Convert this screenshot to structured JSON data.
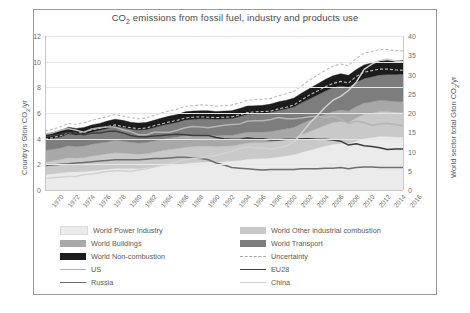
{
  "chart_data": {
    "type": "area",
    "title": "CO2 emissions from fossil fuel, industry and products use",
    "title_parts": {
      "pre": "CO",
      "sub": "2",
      "post": " emissions from fossil fuel, industry and products use"
    },
    "xlabel": "",
    "ylabel": "Country's Gton CO2/yr",
    "ylabel_parts": {
      "pre": "Country's Gton CO",
      "sub": "2",
      "post": "/yr"
    },
    "y2label": "World sector total Gton CO2/yr",
    "y2label_parts": {
      "pre": "World sector total Gton CO",
      "sub": "2",
      "post": "/yr"
    },
    "ylim": [
      0,
      12
    ],
    "y2lim": [
      0,
      40
    ],
    "yticks": [
      0,
      2,
      4,
      6,
      8,
      10,
      12
    ],
    "y2ticks": [
      0,
      5,
      10,
      15,
      20,
      25,
      30,
      35,
      40
    ],
    "grid": true,
    "legend_position": "below",
    "x": [
      1970,
      1971,
      1972,
      1973,
      1974,
      1975,
      1976,
      1977,
      1978,
      1979,
      1980,
      1981,
      1982,
      1983,
      1984,
      1985,
      1986,
      1987,
      1988,
      1989,
      1990,
      1991,
      1992,
      1993,
      1994,
      1995,
      1996,
      1997,
      1998,
      1999,
      2000,
      2001,
      2002,
      2003,
      2004,
      2005,
      2006,
      2007,
      2008,
      2009,
      2010,
      2011,
      2012,
      2013,
      2014,
      2015,
      2016
    ],
    "xticks": [
      "1970",
      "1972",
      "1974",
      "1976",
      "1978",
      "1980",
      "1982",
      "1984",
      "1986",
      "1988",
      "1990",
      "1992",
      "1994",
      "1996",
      "1998",
      "2000",
      "2002",
      "2004",
      "2006",
      "2008",
      "2010",
      "2012",
      "2014",
      "2016"
    ],
    "note_units": "Stacked areas read on right axis (world sector total); country lines read on left axis.",
    "series": [
      {
        "name": "World Power Industry",
        "type": "area-stack",
        "color": "#ebebeb",
        "axis": "right",
        "values": [
          4.0,
          4.2,
          4.4,
          4.7,
          4.7,
          4.8,
          5.0,
          5.2,
          5.4,
          5.6,
          5.6,
          5.6,
          5.6,
          5.7,
          6.0,
          6.3,
          6.5,
          6.7,
          6.9,
          7.1,
          7.2,
          7.3,
          7.3,
          7.4,
          7.5,
          7.7,
          8.0,
          8.1,
          8.2,
          8.3,
          8.6,
          8.9,
          9.2,
          9.8,
          10.3,
          10.9,
          11.4,
          11.9,
          12.1,
          12.0,
          12.7,
          13.4,
          13.6,
          13.9,
          13.9,
          13.8,
          13.7
        ]
      },
      {
        "name": "World Other industrial combustion",
        "type": "area-stack",
        "color": "#c9c9c9",
        "axis": "right",
        "values": [
          3.3,
          3.4,
          3.5,
          3.7,
          3.6,
          3.6,
          3.8,
          3.9,
          4.0,
          4.1,
          4.0,
          3.8,
          3.7,
          3.7,
          3.8,
          3.9,
          4.0,
          4.1,
          4.2,
          4.2,
          4.2,
          4.1,
          4.0,
          4.0,
          4.0,
          4.1,
          4.2,
          4.2,
          4.1,
          4.1,
          4.2,
          4.2,
          4.3,
          4.6,
          4.9,
          5.1,
          5.4,
          5.6,
          5.7,
          5.6,
          6.0,
          6.3,
          6.4,
          6.5,
          6.5,
          6.4,
          6.4
        ]
      },
      {
        "name": "World Buildings",
        "type": "area-stack",
        "color": "#a8a8a8",
        "axis": "right",
        "values": [
          3.0,
          3.0,
          3.0,
          3.1,
          3.0,
          3.0,
          3.1,
          3.1,
          3.1,
          3.2,
          3.1,
          3.0,
          2.9,
          2.9,
          2.9,
          3.0,
          3.0,
          3.0,
          3.1,
          3.0,
          2.9,
          2.9,
          2.8,
          2.8,
          2.7,
          2.8,
          2.9,
          2.8,
          2.8,
          2.8,
          2.8,
          2.8,
          2.8,
          2.9,
          2.9,
          2.9,
          2.9,
          2.9,
          3.0,
          2.9,
          3.0,
          2.9,
          2.9,
          2.9,
          2.8,
          2.8,
          2.8
        ]
      },
      {
        "name": "World Transport",
        "type": "area-stack",
        "color": "#7d7d7d",
        "axis": "right",
        "values": [
          2.7,
          2.8,
          2.9,
          3.1,
          3.0,
          3.1,
          3.2,
          3.3,
          3.5,
          3.6,
          3.5,
          3.4,
          3.4,
          3.4,
          3.5,
          3.6,
          3.7,
          3.8,
          4.0,
          4.1,
          4.2,
          4.2,
          4.3,
          4.3,
          4.4,
          4.5,
          4.6,
          4.7,
          4.8,
          5.0,
          5.1,
          5.2,
          5.3,
          5.4,
          5.6,
          5.8,
          6.0,
          6.2,
          6.2,
          6.2,
          6.3,
          6.4,
          6.5,
          6.6,
          6.8,
          7.0,
          7.2
        ]
      },
      {
        "name": "World Non-combustion",
        "type": "area-stack",
        "color": "#1c1c1c",
        "axis": "right",
        "values": [
          1.5,
          1.5,
          1.6,
          1.7,
          1.7,
          1.7,
          1.8,
          1.8,
          1.9,
          1.9,
          1.9,
          1.8,
          1.8,
          1.8,
          1.9,
          1.9,
          2.0,
          2.0,
          2.1,
          2.1,
          2.1,
          2.1,
          2.0,
          2.0,
          2.0,
          2.1,
          2.1,
          2.1,
          2.1,
          2.1,
          2.2,
          2.2,
          2.3,
          2.5,
          2.7,
          2.8,
          3.0,
          3.1,
          3.2,
          3.1,
          3.3,
          3.5,
          3.6,
          3.6,
          3.6,
          3.5,
          3.5
        ]
      },
      {
        "name": "Uncertainty",
        "type": "line-dashed-band",
        "color": "#bdbdbd",
        "axis": "right",
        "upper": [
          15.3,
          15.8,
          16.4,
          17.3,
          17.1,
          17.4,
          18.1,
          18.6,
          19.1,
          19.6,
          19.2,
          18.8,
          18.5,
          18.7,
          19.4,
          20.0,
          20.6,
          21.0,
          21.7,
          21.9,
          22.1,
          22.0,
          21.8,
          21.9,
          22.1,
          22.6,
          23.3,
          23.5,
          23.6,
          23.8,
          24.5,
          25.0,
          25.6,
          27.1,
          28.6,
          29.8,
          31.1,
          32.2,
          32.7,
          32.3,
          34.2,
          35.5,
          36.0,
          36.5,
          36.5,
          36.2,
          36.1
        ],
        "lower": [
          13.2,
          13.6,
          14.1,
          14.9,
          14.7,
          15.0,
          15.6,
          16.0,
          16.5,
          16.9,
          16.5,
          16.2,
          15.9,
          16.1,
          16.7,
          17.2,
          17.7,
          18.1,
          18.7,
          18.9,
          19.0,
          18.9,
          18.8,
          18.9,
          19.0,
          19.5,
          20.1,
          20.3,
          20.4,
          20.5,
          21.1,
          21.5,
          22.1,
          23.4,
          24.7,
          25.7,
          26.8,
          27.7,
          28.2,
          27.8,
          29.5,
          30.6,
          31.0,
          31.4,
          31.4,
          31.2,
          31.1
        ]
      },
      {
        "name": "US",
        "type": "line",
        "color": "#b4b4b4",
        "axis": "left",
        "values": [
          4.35,
          4.45,
          4.65,
          4.8,
          4.65,
          4.5,
          4.75,
          4.85,
          4.9,
          4.9,
          4.7,
          4.55,
          4.3,
          4.3,
          4.5,
          4.5,
          4.5,
          4.65,
          4.85,
          4.95,
          4.9,
          4.85,
          4.95,
          5.05,
          5.1,
          5.15,
          5.35,
          5.4,
          5.4,
          5.5,
          5.65,
          5.55,
          5.55,
          5.6,
          5.7,
          5.75,
          5.65,
          5.75,
          5.55,
          5.2,
          5.35,
          5.25,
          5.05,
          5.15,
          5.2,
          5.1,
          5.0
        ]
      },
      {
        "name": "EU28",
        "type": "line",
        "color": "#3d3d3d",
        "axis": "left",
        "values": [
          4.15,
          4.25,
          4.35,
          4.5,
          4.4,
          4.3,
          4.45,
          4.45,
          4.55,
          4.6,
          4.45,
          4.25,
          4.15,
          4.15,
          4.2,
          4.25,
          4.3,
          4.35,
          4.3,
          4.25,
          4.25,
          4.25,
          4.1,
          4.0,
          3.95,
          3.95,
          4.05,
          4.0,
          4.0,
          3.9,
          3.9,
          3.95,
          3.95,
          4.0,
          4.0,
          3.95,
          3.95,
          3.9,
          3.8,
          3.5,
          3.6,
          3.45,
          3.4,
          3.3,
          3.15,
          3.2,
          3.2
        ]
      },
      {
        "name": "Russia",
        "type": "line",
        "color": "#6e6e6e",
        "axis": "left",
        "values": [
          1.9,
          1.95,
          2.0,
          2.05,
          2.1,
          2.15,
          2.2,
          2.25,
          2.3,
          2.35,
          2.35,
          2.35,
          2.35,
          2.4,
          2.45,
          2.45,
          2.5,
          2.55,
          2.55,
          2.5,
          2.45,
          2.35,
          2.1,
          1.95,
          1.75,
          1.7,
          1.65,
          1.6,
          1.55,
          1.6,
          1.6,
          1.6,
          1.6,
          1.65,
          1.65,
          1.65,
          1.7,
          1.7,
          1.75,
          1.65,
          1.75,
          1.8,
          1.8,
          1.75,
          1.75,
          1.75,
          1.75
        ]
      },
      {
        "name": "China",
        "type": "line",
        "color": "#d2d2d2",
        "axis": "left",
        "values": [
          0.9,
          0.95,
          1.0,
          1.05,
          1.05,
          1.2,
          1.25,
          1.35,
          1.45,
          1.5,
          1.5,
          1.45,
          1.55,
          1.65,
          1.8,
          1.95,
          2.05,
          2.2,
          2.35,
          2.45,
          2.5,
          2.6,
          2.7,
          2.85,
          3.0,
          3.25,
          3.35,
          3.3,
          3.25,
          3.2,
          3.3,
          3.45,
          3.75,
          4.45,
          5.2,
          5.8,
          6.45,
          7.0,
          7.3,
          7.75,
          8.4,
          9.4,
          9.8,
          10.1,
          10.2,
          10.05,
          10.0
        ]
      }
    ]
  },
  "legend": {
    "items": [
      {
        "label": "World Power Industry",
        "swatch": "area",
        "color": "#ebebeb"
      },
      {
        "label": "World Other industrial combustion",
        "swatch": "area",
        "color": "#c9c9c9"
      },
      {
        "label": "World Buildings",
        "swatch": "area",
        "color": "#a8a8a8"
      },
      {
        "label": "World Transport",
        "swatch": "area",
        "color": "#7d7d7d"
      },
      {
        "label": "World Non-combustion",
        "swatch": "area",
        "color": "#1c1c1c"
      },
      {
        "label": "Uncertainty",
        "swatch": "dashed",
        "color": "#a8a8a8"
      },
      {
        "label": "US",
        "swatch": "line",
        "color": "#b4b4b4"
      },
      {
        "label": "EU28",
        "swatch": "line",
        "color": "#3d3d3d"
      },
      {
        "label": "Russia",
        "swatch": "line",
        "color": "#6e6e6e"
      },
      {
        "label": "China",
        "swatch": "line",
        "color": "#d2d2d2"
      }
    ]
  }
}
